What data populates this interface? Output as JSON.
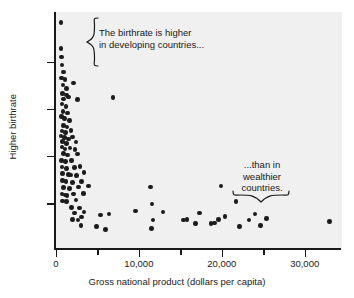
{
  "chart_data": {
    "type": "scatter",
    "title": "",
    "xlabel": "Gross national product (dollars per capita)",
    "ylabel": "Higher birthrate",
    "xlim": [
      0,
      34500
    ],
    "ylim": [
      0,
      1
    ],
    "grid": false,
    "legend": null,
    "x_ticks": [
      {
        "value": 0,
        "label": "0",
        "type": "major"
      },
      {
        "value": 5000,
        "label": "",
        "type": "minor"
      },
      {
        "value": 10000,
        "label": "10,000",
        "type": "major"
      },
      {
        "value": 15000,
        "label": "",
        "type": "minor"
      },
      {
        "value": 20000,
        "label": "20,000",
        "type": "major"
      },
      {
        "value": 25000,
        "label": "",
        "type": "minor"
      },
      {
        "value": 30000,
        "label": "30,000",
        "type": "major"
      }
    ],
    "y_ticks": [
      {
        "value": 0.19,
        "label": ""
      },
      {
        "value": 0.39,
        "label": ""
      },
      {
        "value": 0.59,
        "label": ""
      },
      {
        "value": 0.79,
        "label": ""
      }
    ],
    "marker": {
      "shape": "circle",
      "color": "#1c1c1c",
      "size": 4.6
    },
    "panel_color": "#f0f0f0",
    "axis_color": "#1a1a1a",
    "points": [
      {
        "x": 600,
        "y": 0.955
      },
      {
        "x": 620,
        "y": 0.845
      },
      {
        "x": 640,
        "y": 0.81
      },
      {
        "x": 700,
        "y": 0.775
      },
      {
        "x": 900,
        "y": 0.745
      },
      {
        "x": 660,
        "y": 0.72
      },
      {
        "x": 1100,
        "y": 0.713
      },
      {
        "x": 820,
        "y": 0.69
      },
      {
        "x": 1250,
        "y": 0.676
      },
      {
        "x": 2100,
        "y": 0.7
      },
      {
        "x": 760,
        "y": 0.655
      },
      {
        "x": 1300,
        "y": 0.648
      },
      {
        "x": 900,
        "y": 0.632
      },
      {
        "x": 1500,
        "y": 0.64
      },
      {
        "x": 2600,
        "y": 0.628
      },
      {
        "x": 700,
        "y": 0.61
      },
      {
        "x": 1200,
        "y": 0.6
      },
      {
        "x": 6900,
        "y": 0.637
      },
      {
        "x": 820,
        "y": 0.578
      },
      {
        "x": 1400,
        "y": 0.572
      },
      {
        "x": 640,
        "y": 0.556
      },
      {
        "x": 1050,
        "y": 0.548
      },
      {
        "x": 1600,
        "y": 0.54
      },
      {
        "x": 900,
        "y": 0.52
      },
      {
        "x": 1350,
        "y": 0.512
      },
      {
        "x": 700,
        "y": 0.496
      },
      {
        "x": 1150,
        "y": 0.489
      },
      {
        "x": 1800,
        "y": 0.497
      },
      {
        "x": 600,
        "y": 0.474
      },
      {
        "x": 1000,
        "y": 0.468
      },
      {
        "x": 1500,
        "y": 0.462
      },
      {
        "x": 2000,
        "y": 0.47
      },
      {
        "x": 800,
        "y": 0.452
      },
      {
        "x": 1250,
        "y": 0.444
      },
      {
        "x": 2400,
        "y": 0.45
      },
      {
        "x": 700,
        "y": 0.428
      },
      {
        "x": 1100,
        "y": 0.42
      },
      {
        "x": 1700,
        "y": 0.424
      },
      {
        "x": 2300,
        "y": 0.418
      },
      {
        "x": 900,
        "y": 0.4
      },
      {
        "x": 1400,
        "y": 0.394
      },
      {
        "x": 2600,
        "y": 0.398
      },
      {
        "x": 650,
        "y": 0.372
      },
      {
        "x": 1150,
        "y": 0.366
      },
      {
        "x": 1900,
        "y": 0.37
      },
      {
        "x": 700,
        "y": 0.344
      },
      {
        "x": 1300,
        "y": 0.338
      },
      {
        "x": 2200,
        "y": 0.34
      },
      {
        "x": 2900,
        "y": 0.346
      },
      {
        "x": 800,
        "y": 0.316
      },
      {
        "x": 1500,
        "y": 0.312
      },
      {
        "x": 1750,
        "y": 0.31
      },
      {
        "x": 2500,
        "y": 0.308
      },
      {
        "x": 3400,
        "y": 0.32
      },
      {
        "x": 750,
        "y": 0.286
      },
      {
        "x": 1200,
        "y": 0.282
      },
      {
        "x": 2000,
        "y": 0.278
      },
      {
        "x": 3100,
        "y": 0.283
      },
      {
        "x": 900,
        "y": 0.256
      },
      {
        "x": 1600,
        "y": 0.252
      },
      {
        "x": 2700,
        "y": 0.258
      },
      {
        "x": 3900,
        "y": 0.262
      },
      {
        "x": 700,
        "y": 0.228
      },
      {
        "x": 1100,
        "y": 0.224
      },
      {
        "x": 1350,
        "y": 0.222
      },
      {
        "x": 2100,
        "y": 0.228
      },
      {
        "x": 3300,
        "y": 0.232
      },
      {
        "x": 800,
        "y": 0.2
      },
      {
        "x": 1250,
        "y": 0.198
      },
      {
        "x": 2400,
        "y": 0.204
      },
      {
        "x": 1900,
        "y": 0.172
      },
      {
        "x": 2800,
        "y": 0.17
      },
      {
        "x": 2200,
        "y": 0.148
      },
      {
        "x": 3400,
        "y": 0.152
      },
      {
        "x": 2000,
        "y": 0.12
      },
      {
        "x": 2650,
        "y": 0.118
      },
      {
        "x": 3100,
        "y": 0.132
      },
      {
        "x": 3000,
        "y": 0.096
      },
      {
        "x": 4900,
        "y": 0.092
      },
      {
        "x": 6000,
        "y": 0.078
      },
      {
        "x": 5400,
        "y": 0.14
      },
      {
        "x": 6400,
        "y": 0.144
      },
      {
        "x": 9600,
        "y": 0.156
      },
      {
        "x": 11400,
        "y": 0.258
      },
      {
        "x": 11600,
        "y": 0.186
      },
      {
        "x": 11700,
        "y": 0.118
      },
      {
        "x": 11500,
        "y": 0.082
      },
      {
        "x": 12900,
        "y": 0.152
      },
      {
        "x": 15400,
        "y": 0.118
      },
      {
        "x": 15800,
        "y": 0.12
      },
      {
        "x": 16800,
        "y": 0.104
      },
      {
        "x": 17300,
        "y": 0.148
      },
      {
        "x": 18700,
        "y": 0.104
      },
      {
        "x": 19100,
        "y": 0.106
      },
      {
        "x": 19900,
        "y": 0.262
      },
      {
        "x": 19600,
        "y": 0.122
      },
      {
        "x": 20400,
        "y": 0.134
      },
      {
        "x": 21700,
        "y": 0.196
      },
      {
        "x": 22100,
        "y": 0.092
      },
      {
        "x": 23300,
        "y": 0.118
      },
      {
        "x": 24000,
        "y": 0.144
      },
      {
        "x": 24700,
        "y": 0.096
      },
      {
        "x": 25400,
        "y": 0.124
      },
      {
        "x": 33000,
        "y": 0.112
      }
    ],
    "annotations": [
      {
        "id": "developing",
        "text": "The birthrate is higher\nin developing countries...",
        "brace": "left-vertical"
      },
      {
        "id": "wealthy",
        "text": "...than in\nwealthier\ncountries.",
        "brace": "bottom-horizontal"
      }
    ]
  }
}
